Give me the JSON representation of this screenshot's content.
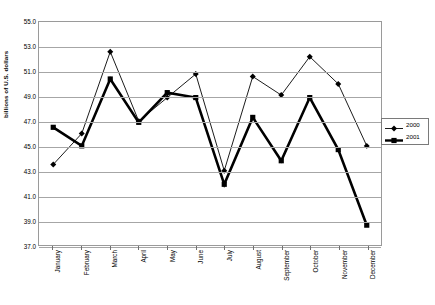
{
  "chart_data": {
    "type": "line",
    "title": "",
    "xlabel": "",
    "ylabel": "billions of U.S. dollars",
    "ylim": [
      37.0,
      55.0
    ],
    "ytick_step": 2.0,
    "grid": true,
    "legend_position": "right",
    "categories": [
      "January",
      "February",
      "March",
      "April",
      "May",
      "June",
      "July",
      "August",
      "September",
      "October",
      "November",
      "December"
    ],
    "series": [
      {
        "name": "2000",
        "marker": "diamond",
        "line_width": "thin",
        "color": "#000000",
        "values": [
          43.5,
          46.0,
          52.6,
          47.0,
          48.9,
          50.8,
          43.0,
          50.6,
          49.1,
          52.2,
          50.0,
          45.0
        ]
      },
      {
        "name": "2001",
        "marker": "square",
        "line_width": "thick",
        "color": "#000000",
        "values": [
          46.5,
          45.0,
          50.4,
          46.9,
          49.3,
          48.9,
          41.9,
          47.3,
          43.8,
          48.9,
          44.7,
          38.6
        ]
      }
    ],
    "ytick_labels": [
      "55.0",
      "53.0",
      "51.0",
      "49.0",
      "47.0",
      "45.0",
      "43.0",
      "41.0",
      "39.0",
      "37.0"
    ],
    "ytick_values": [
      55.0,
      53.0,
      51.0,
      49.0,
      47.0,
      45.0,
      43.0,
      41.0,
      39.0,
      37.0
    ]
  },
  "legend": {
    "entries": [
      {
        "label": "2000"
      },
      {
        "label": "2001"
      }
    ]
  },
  "axes": {
    "y_title": "billions of U.S. dollars"
  }
}
